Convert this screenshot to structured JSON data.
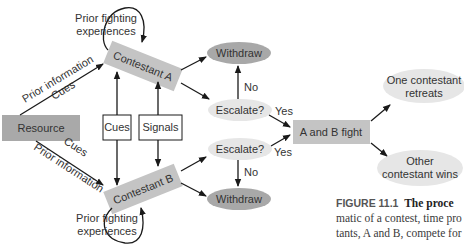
{
  "diagram": {
    "nodes": {
      "resource": "Resource",
      "contestant_a": "Contestant A",
      "contestant_b": "Contestant B",
      "cues_box": "Cues",
      "signals_box": "Signals",
      "escalate_a": "Escalate?",
      "escalate_b": "Escalate?",
      "withdraw_a": "Withdraw",
      "withdraw_b": "Withdraw",
      "fight": "A and B fight",
      "retreats_line1": "One contestant",
      "retreats_line2": "retreats",
      "wins_line1": "Other",
      "wins_line2": "contestant wins"
    },
    "edge_labels": {
      "prior_fighting_a_line1": "Prior fighting",
      "prior_fighting_a_line2": "experiences",
      "prior_fighting_b_line1": "Prior fighting",
      "prior_fighting_b_line2": "experiences",
      "prior_info_a": "Prior information",
      "cues_a": "Cues",
      "prior_info_b": "Prior information",
      "cues_b": "Cues",
      "no_a": "No",
      "no_b": "No",
      "yes_a": "Yes",
      "yes_b": "Yes"
    },
    "colors": {
      "box_fill": "#c4c4c4",
      "resource_fill": "#a9a9a9",
      "ellipse_light": "#e6e6e6",
      "ellipse_dark": "#a8a8a8",
      "arrow": "#1a1a1a"
    }
  },
  "caption": {
    "figure_label": "FIGURE 11.1",
    "title": "The proce",
    "line2": "matic of a contest, time pro",
    "line3": "tants, A and B, compete for"
  }
}
